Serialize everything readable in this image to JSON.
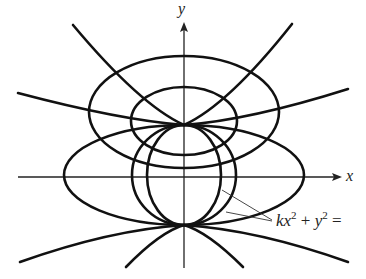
{
  "figure": {
    "axes": {
      "x_label": "x",
      "y_label": "y",
      "origin": [
        184,
        176
      ],
      "x_axis": {
        "from": 18,
        "to": 340
      },
      "y_axis": {
        "from": 268,
        "to": 23
      }
    },
    "tangent_points": [
      [
        184,
        125
      ],
      [
        184,
        225
      ]
    ],
    "family_label": {
      "k": "k",
      "x": "x",
      "sup1": "2",
      "plus": " + ",
      "y": "y",
      "sup2": "2",
      "eq": " ="
    },
    "ellipses_family": [
      {
        "name": "wide-ellipse",
        "cx": 184,
        "cy": 175,
        "rx": 120,
        "ry": 50
      },
      {
        "name": "circle-ellipse",
        "cx": 184,
        "cy": 175,
        "rx": 52,
        "ry": 50
      },
      {
        "name": "narrow-ellipse",
        "cx": 184,
        "cy": 175,
        "rx": 37,
        "ry": 50
      }
    ],
    "upper_ellipses": [
      {
        "name": "upper-large-ellipse",
        "cx": 184,
        "cy": 112,
        "rx": 95,
        "ry": 56
      },
      {
        "name": "upper-small-ellipse",
        "cx": 184,
        "cy": 122,
        "rx": 53,
        "ry": 34
      }
    ],
    "colors": {
      "stroke": "#111111",
      "background": "#ffffff"
    }
  }
}
